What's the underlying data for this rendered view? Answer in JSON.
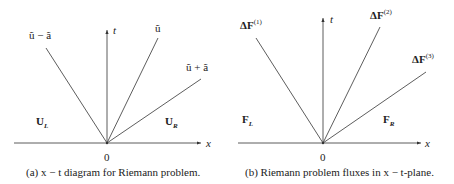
{
  "figure_a": {
    "caption": "(a)  x − t diagram for Riemann problem.",
    "axis_x_label": "x",
    "axis_t_label": "t",
    "origin_label": "0",
    "wave_labels": [
      "ũ − ã",
      "ũ",
      "ũ + ã"
    ],
    "region_left": {
      "main": "U",
      "sub": "L"
    },
    "region_right": {
      "main": "U",
      "sub": "R"
    }
  },
  "figure_b": {
    "caption": "(b)  Riemann problem fluxes in x − t-plane.",
    "axis_x_label": "x",
    "axis_t_label": "t",
    "origin_label": "0",
    "wave_labels": [
      {
        "main": "ΔF",
        "sup": "(1)"
      },
      {
        "main": "ΔF",
        "sup": "(2)"
      },
      {
        "main": "ΔF",
        "sup": "(3)"
      }
    ],
    "region_left": {
      "main": "F",
      "sub": "L"
    },
    "region_right": {
      "main": "F",
      "sub": "R"
    }
  },
  "colors": {
    "line": "#333333",
    "text": "#222222"
  }
}
